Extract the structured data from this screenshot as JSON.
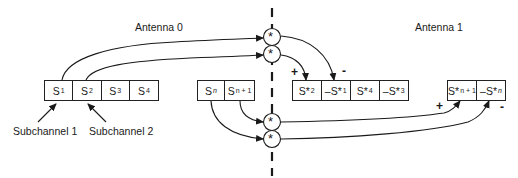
{
  "diagram": {
    "antenna0_label": "Antenna 0",
    "antenna1_label": "Antenna 1",
    "subchannel1_label": "Subchannel 1",
    "subchannel2_label": "Subchannel 2",
    "combiner_symbol": "*",
    "antenna0_blocks": [
      {
        "base": "S",
        "sub": "1"
      },
      {
        "base": "S",
        "sub": "2"
      },
      {
        "base": "S",
        "sub": "3"
      },
      {
        "base": "S",
        "sub": "4"
      }
    ],
    "antenna0_blocks_n": [
      {
        "base": "S",
        "sub": "n"
      },
      {
        "base": "S",
        "sub": "n + 1"
      }
    ],
    "antenna1_blocks": [
      {
        "base": "S*",
        "sub": "2"
      },
      {
        "base": "–S*",
        "sub": "1"
      },
      {
        "base": "S*",
        "sub": "4"
      },
      {
        "base": "–S*",
        "sub": "3"
      }
    ],
    "antenna1_blocks_n": [
      {
        "base": "S*",
        "sub": "n + 1"
      },
      {
        "base": "–S*",
        "sub": "n"
      }
    ],
    "signs": {
      "plus": "+",
      "minus": "-"
    },
    "colors": {
      "line": "#1a1a1a",
      "background": "#ffffff"
    }
  }
}
